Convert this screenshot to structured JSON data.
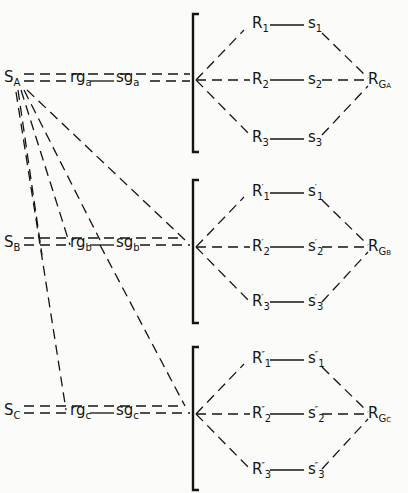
{
  "diagram": {
    "sources": [
      {
        "id": "S_A",
        "main": "S",
        "sub": "A",
        "rg": "rg",
        "rg_sub": "a",
        "sg": "sg",
        "sg_sub": "a",
        "result": "R",
        "result_sub": "G",
        "result_subsub": "A"
      },
      {
        "id": "S_B",
        "main": "S",
        "sub": "B",
        "rg": "rg",
        "rg_sub": "b",
        "sg": "sg",
        "sg_sub": "b",
        "result": "R",
        "result_sub": "G",
        "result_subsub": "B"
      },
      {
        "id": "S_C",
        "main": "S",
        "sub": "C",
        "rg": "rg",
        "rg_sub": "c",
        "sg": "sg",
        "sg_sub": "c",
        "result": "R",
        "result_sub": "G",
        "result_subsub": "C"
      }
    ],
    "groups": [
      {
        "prime": "",
        "nodes": [
          {
            "r": "R",
            "r_sub": "1",
            "s": "s",
            "s_sub": "1"
          },
          {
            "r": "R",
            "r_sub": "2",
            "s": "s",
            "s_sub": "2"
          },
          {
            "r": "R",
            "r_sub": "3",
            "s": "s",
            "s_sub": "3"
          }
        ]
      },
      {
        "prime": "′",
        "nodes": [
          {
            "r": "R",
            "r_sub": "1",
            "s": "s",
            "s_sub": "1"
          },
          {
            "r": "R",
            "r_sub": "2",
            "s": "s",
            "s_sub": "2"
          },
          {
            "r": "R",
            "r_sub": "3",
            "s": "s",
            "s_sub": "3"
          }
        ]
      },
      {
        "prime": "″",
        "nodes": [
          {
            "r": "R",
            "r_sub": "1",
            "s": "s",
            "s_sub": "1"
          },
          {
            "r": "R",
            "r_sub": "2",
            "s": "s",
            "s_sub": "2"
          },
          {
            "r": "R",
            "r_sub": "3",
            "s": "s",
            "s_sub": "3"
          }
        ]
      }
    ]
  }
}
